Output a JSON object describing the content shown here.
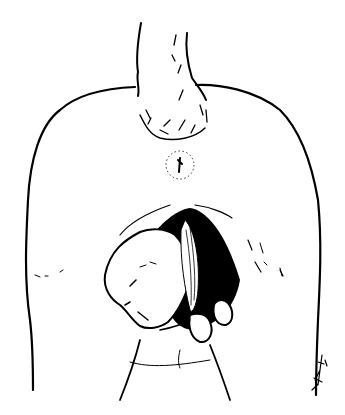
{
  "illustration": {
    "subject": "line drawing of an infant emerging from an abdominal incision (cesarean delivery)",
    "style": "black ink on white",
    "colors": {
      "ink": "#000000",
      "background": "#ffffff"
    },
    "signature": {
      "position": "bottom-right",
      "legible": false
    }
  }
}
